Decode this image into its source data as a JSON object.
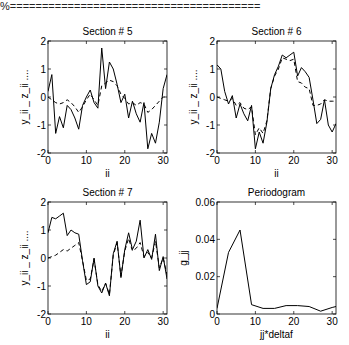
{
  "header": {
    "text": "%======================================="
  },
  "chart_data": [
    {
      "type": "line",
      "title": "Section # 5",
      "xlabel": "ii",
      "ylabel": "y_ii _  z_ii ....",
      "xlim": [
        0,
        31
      ],
      "ylim": [
        -2,
        2
      ],
      "xticks": [
        0,
        10,
        20,
        30
      ],
      "yticks": [
        -2,
        -1,
        0,
        1,
        2
      ],
      "grid": false,
      "x": [
        0,
        1,
        2,
        3,
        4,
        5,
        6,
        7,
        8,
        9,
        10,
        11,
        12,
        13,
        14,
        15,
        16,
        17,
        18,
        19,
        20,
        21,
        22,
        23,
        24,
        25,
        26,
        27,
        28,
        29,
        30,
        31
      ],
      "series": [
        {
          "name": "y_ii",
          "style": "solid",
          "values": [
            0.2,
            0.8,
            -1.3,
            -0.7,
            -1.1,
            -0.3,
            -0.45,
            -0.75,
            -1.15,
            -0.3,
            0.0,
            0.25,
            -0.2,
            -0.4,
            1.75,
            0.3,
            1.25,
            1.0,
            0.45,
            -0.2,
            0.1,
            -0.75,
            -0.15,
            -0.6,
            -0.9,
            -0.2,
            -1.85,
            -1.3,
            -1.65,
            -0.9,
            0.3,
            0.8
          ]
        },
        {
          "name": "z_ii",
          "style": "dashed",
          "values": [
            0.0,
            -0.1,
            -0.2,
            -0.25,
            -0.2,
            -0.1,
            -0.2,
            -0.35,
            -0.55,
            -0.35,
            -0.1,
            0.1,
            -0.1,
            -0.3,
            0.4,
            0.5,
            0.6,
            0.55,
            0.4,
            0.1,
            -0.05,
            -0.25,
            -0.2,
            -0.3,
            -0.2,
            -0.25,
            -0.55,
            -0.45,
            -0.3,
            -0.15,
            0.0,
            0.0
          ]
        }
      ]
    },
    {
      "type": "line",
      "title": "Section # 6",
      "xlabel": "ii",
      "ylabel": "y_ii _  z_ii ....",
      "xlim": [
        0,
        31
      ],
      "ylim": [
        -2,
        2
      ],
      "xticks": [
        0,
        10,
        20,
        30
      ],
      "yticks": [
        -2,
        -1,
        0,
        1,
        2
      ],
      "grid": false,
      "x": [
        0,
        1,
        2,
        3,
        4,
        5,
        6,
        7,
        8,
        9,
        10,
        11,
        12,
        13,
        14,
        15,
        16,
        17,
        18,
        19,
        20,
        21,
        22,
        23,
        24,
        25,
        26,
        27,
        28,
        29,
        30,
        31
      ],
      "series": [
        {
          "name": "y_ii",
          "style": "solid",
          "values": [
            1.15,
            1.0,
            0.2,
            -0.25,
            0.05,
            -0.75,
            -0.25,
            -0.6,
            -0.85,
            -0.3,
            -1.85,
            -1.25,
            -1.65,
            -0.9,
            0.3,
            0.8,
            1.1,
            1.5,
            1.4,
            1.5,
            1.6,
            0.75,
            1.05,
            0.9,
            0.7,
            -0.1,
            -0.95,
            -0.8,
            -0.1,
            -1.0,
            -1.25,
            -0.95
          ]
        },
        {
          "name": "z_ii",
          "style": "dashed",
          "values": [
            0.0,
            -0.05,
            -0.1,
            -0.15,
            -0.05,
            -0.3,
            -0.2,
            -0.4,
            -0.45,
            -0.35,
            -1.35,
            -1.1,
            -1.3,
            -0.85,
            0.3,
            0.75,
            1.0,
            1.4,
            1.35,
            1.3,
            1.35,
            0.55,
            0.5,
            0.35,
            0.3,
            -0.3,
            -0.3,
            -0.25,
            -0.1,
            -0.15,
            -0.15,
            -0.15
          ]
        }
      ]
    },
    {
      "type": "line",
      "title": "Section # 7",
      "xlabel": "ii",
      "ylabel": "y_ii _  z_ii ....",
      "xlim": [
        0,
        31
      ],
      "ylim": [
        -2,
        2
      ],
      "xticks": [
        0,
        10,
        20,
        30
      ],
      "yticks": [
        -2,
        -1,
        0,
        1,
        2
      ],
      "grid": false,
      "x": [
        0,
        1,
        2,
        3,
        4,
        5,
        6,
        7,
        8,
        9,
        10,
        11,
        12,
        13,
        14,
        15,
        16,
        17,
        18,
        19,
        20,
        21,
        22,
        23,
        24,
        25,
        26,
        27,
        28,
        29,
        30,
        31
      ],
      "series": [
        {
          "name": "y_ii",
          "style": "solid",
          "values": [
            0.9,
            1.45,
            1.4,
            1.5,
            1.6,
            0.8,
            1.0,
            0.9,
            0.85,
            -0.1,
            -0.95,
            -0.85,
            0.0,
            -1.0,
            -1.25,
            -0.9,
            -1.35,
            0.15,
            0.6,
            -0.7,
            0.3,
            0.9,
            0.3,
            0.6,
            1.35,
            0.0,
            0.3,
            -0.05,
            0.85,
            -0.45,
            0.05,
            -0.75
          ]
        },
        {
          "name": "z_ii",
          "style": "dashed",
          "values": [
            0.0,
            0.05,
            0.1,
            0.2,
            0.3,
            0.25,
            0.35,
            0.45,
            0.55,
            -0.1,
            -0.8,
            -0.75,
            -0.05,
            -0.95,
            -1.2,
            -0.9,
            -1.3,
            0.1,
            0.55,
            -0.65,
            0.25,
            0.7,
            0.25,
            0.35,
            0.55,
            0.05,
            0.2,
            0.0,
            0.6,
            -0.35,
            0.0,
            -0.6
          ]
        }
      ]
    },
    {
      "type": "line",
      "title": "Periodogram",
      "xlabel": "jj*deltaf",
      "ylabel": "g_jj",
      "xlim": [
        0,
        31
      ],
      "ylim": [
        0,
        0.06
      ],
      "xticks": [
        0,
        10,
        20,
        30
      ],
      "yticks": [
        0,
        0.02,
        0.04,
        0.06
      ],
      "grid": false,
      "x": [
        0,
        3,
        6,
        9,
        12,
        15,
        18,
        21,
        24,
        27,
        30,
        31
      ],
      "series": [
        {
          "name": "g_jj",
          "style": "solid",
          "values": [
            0.003,
            0.033,
            0.045,
            0.005,
            0.003,
            0.003,
            0.0045,
            0.0045,
            0.004,
            0.0015,
            0.0035,
            0.004
          ]
        }
      ]
    }
  ]
}
